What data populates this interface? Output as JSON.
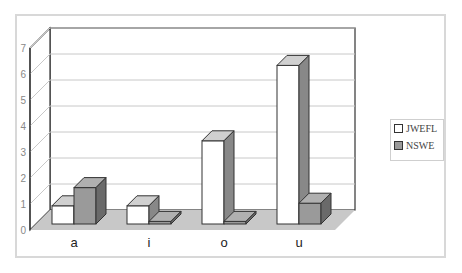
{
  "chart_data": {
    "type": "bar",
    "style": "3d-clustered-column",
    "title": "",
    "xlabel": "",
    "ylabel": "",
    "categories": [
      "a",
      "i",
      "o",
      "u"
    ],
    "series": [
      {
        "name": "JWEFL",
        "color": "#ffffff",
        "values": [
          0.7,
          0.7,
          3.2,
          6.1
        ]
      },
      {
        "name": "NSWE",
        "color": "#9a9a9a",
        "values": [
          1.4,
          0.1,
          0.1,
          0.8
        ]
      }
    ],
    "y_ticks": [
      "0",
      "1",
      "2",
      "3",
      "4",
      "5",
      "6",
      "7"
    ],
    "ylim": [
      0,
      7
    ],
    "grid": true,
    "legend_position": "right",
    "floor_color": "#c8c8c8"
  },
  "legend": {
    "items": [
      {
        "label": "JWEFL",
        "color": "#ffffff"
      },
      {
        "label": "NSWE",
        "color": "#9a9a9a"
      }
    ]
  }
}
